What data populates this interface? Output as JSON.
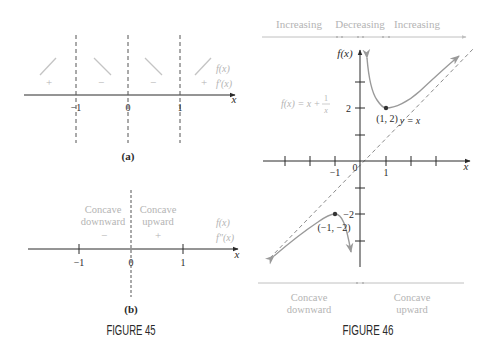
{
  "figure45": {
    "caption": "FIGURE 45",
    "panel_a": {
      "label": "(a)",
      "axis_label": "x",
      "ticks": [
        "−1",
        "0",
        "1"
      ],
      "row_labels": {
        "f": "f(x)",
        "fprime": "f′(x)"
      },
      "signs": [
        "+",
        "−",
        "−",
        "+"
      ],
      "arrows": [
        "up",
        "down",
        "down",
        "up"
      ]
    },
    "panel_b": {
      "label": "(b)",
      "axis_label": "x",
      "ticks": [
        "−1",
        "0",
        "1"
      ],
      "row_labels": {
        "f": "f(x)",
        "fsecond": "f″(x)"
      },
      "left_region": {
        "line1": "Concave",
        "line2": "downward",
        "sign": "−"
      },
      "right_region": {
        "line1": "Concave",
        "line2": "upward",
        "sign": "+"
      }
    }
  },
  "figure46": {
    "caption": "FIGURE 46",
    "top_intervals": [
      "Increasing",
      "Decreasing",
      "Increasing"
    ],
    "bottom_intervals": [
      {
        "line1": "Concave",
        "line2": "downward"
      },
      {
        "line1": "Concave",
        "line2": "upward"
      }
    ],
    "y_axis_label": "f(x)",
    "x_axis_label": "x",
    "origin_label": "0",
    "x_tick_labels": [
      "−1",
      "1"
    ],
    "y_tick_labels": [
      "2",
      "−2"
    ],
    "function_label": {
      "lhs": "f(x) = x +",
      "num": "1",
      "den": "x"
    },
    "asymptote_label": "y = x",
    "points": [
      {
        "label": "(1, 2)",
        "x": 1,
        "y": 2
      },
      {
        "label": "(−1, −2)",
        "x": -1,
        "y": -2
      }
    ]
  },
  "colors": {
    "ink": "#2a2a2a",
    "faint": "#b4b4b4",
    "curve": "#9a9a9a"
  }
}
